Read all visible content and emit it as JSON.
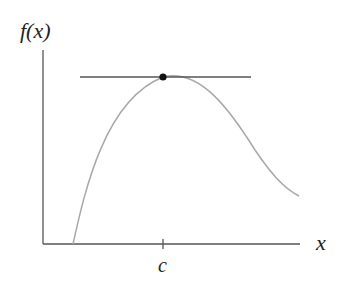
{
  "diagram": {
    "y_axis_label": "f(x)",
    "x_axis_label": "x",
    "tick_label": "c",
    "colors": {
      "axis": "#555555",
      "curve": "#a8a8a8",
      "tangent": "#555555",
      "point": "#111111"
    }
  }
}
